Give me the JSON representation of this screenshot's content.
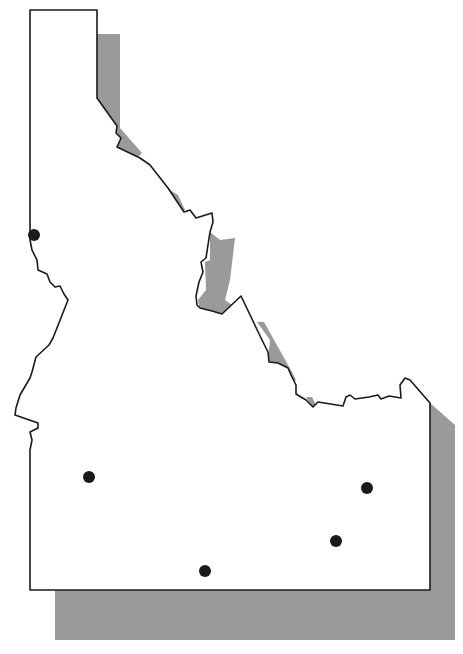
{
  "map": {
    "subject": "Idaho state outline",
    "style": {
      "fill": "#ffffff",
      "outline": "#1a1a1a",
      "shadow": "#9a9a9a",
      "marker": "#1a1a1a"
    },
    "markers": [
      {
        "id": "marker-north-west",
        "x": 34,
        "y": 235,
        "r": 6
      },
      {
        "id": "marker-south-west",
        "x": 89,
        "y": 477,
        "r": 6
      },
      {
        "id": "marker-south-central",
        "x": 205,
        "y": 571,
        "r": 6
      },
      {
        "id": "marker-south-east-1",
        "x": 336,
        "y": 541,
        "r": 6
      },
      {
        "id": "marker-south-east-2",
        "x": 367,
        "y": 488,
        "r": 6
      }
    ]
  }
}
